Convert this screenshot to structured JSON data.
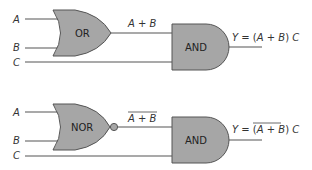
{
  "circuits": [
    {
      "inputs": {
        "a": "A",
        "b": "B",
        "c": "C"
      },
      "gate1": {
        "name": "OR",
        "output": "A + B",
        "inverted": false
      },
      "gate2": {
        "name": "AND"
      },
      "output": {
        "prefix": "Y = ",
        "expr": "(A + B)",
        "suffix": " C"
      }
    },
    {
      "inputs": {
        "a": "A",
        "b": "B",
        "c": "C"
      },
      "gate1": {
        "name": "NOR",
        "output": "A + B",
        "inverted": true
      },
      "gate2": {
        "name": "AND"
      },
      "output": {
        "prefix": "Y = ",
        "expr": "(A + B)",
        "suffix": " C",
        "overbar": "A + B"
      }
    }
  ],
  "colors": {
    "gate_fill": "#a6a6a6",
    "wire": "#555555"
  }
}
